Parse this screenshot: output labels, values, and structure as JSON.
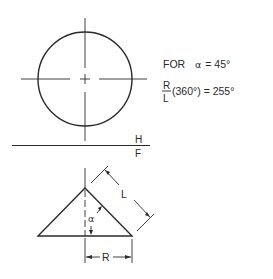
{
  "diagram": {
    "type": "engineering-drawing",
    "colors": {
      "line": "#2a2a2a",
      "background": "#ffffff"
    }
  },
  "top_view": {
    "shape": "circle",
    "center_marks": true
  },
  "plane_labels": {
    "upper": "H",
    "lower": "F"
  },
  "formula": {
    "line1_prefix": "FOR",
    "line1_symbol": "α",
    "line1_value": "= 45°",
    "numerator": "R",
    "denominator": "L",
    "line2_expr": "(360°) = 255°"
  },
  "front_view": {
    "shape": "triangle",
    "dimension_slant": "L",
    "dimension_radius": "R",
    "angle_label": "α"
  }
}
